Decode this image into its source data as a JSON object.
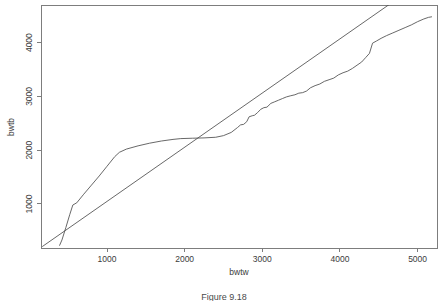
{
  "figure": {
    "caption": "Figure 9.18",
    "background_color": "#ffffff",
    "line_color": "#4d4d4d",
    "axis_color": "#7d7d7d",
    "text_color": "#3b3b3b"
  },
  "chart_data": {
    "type": "line",
    "title": "",
    "subtitle": "",
    "xlabel": "bwtw",
    "ylabel": "bwtb",
    "xlim": [
      150,
      5250
    ],
    "ylim": [
      180,
      4700
    ],
    "xticks": [
      1000,
      2000,
      3000,
      4000,
      5000
    ],
    "xtick_labels": [
      "1000",
      "2000",
      "3000",
      "4000",
      "5000"
    ],
    "yticks": [
      1000,
      2000,
      3000,
      4000
    ],
    "ytick_labels": [
      "1000",
      "2000",
      "3000",
      "4000"
    ],
    "grid": false,
    "legend": "none",
    "box": true,
    "series": [
      {
        "name": "reference-line",
        "style": "straight",
        "description": "straight diagonal reference line",
        "x": [
          170,
          5250
        ],
        "y": [
          210,
          5330
        ]
      },
      {
        "name": "empirical-curve",
        "style": "stepped",
        "description": "stepped empirical curve rising steeply then flattening",
        "x": [
          390,
          420,
          470,
          520,
          560,
          610,
          700,
          800,
          900,
          1000,
          1100,
          1160,
          1250,
          1400,
          1550,
          1700,
          1850,
          1950,
          2100,
          2250,
          2400,
          2500,
          2600,
          2680,
          2720,
          2760,
          2800,
          2830,
          2870,
          2900,
          2940,
          2980,
          3020,
          3060,
          3110,
          3160,
          3210,
          3260,
          3310,
          3360,
          3420,
          3470,
          3520,
          3570,
          3620,
          3680,
          3740,
          3800,
          3860,
          3920,
          3980,
          4040,
          4100,
          4160,
          4220,
          4280,
          4330,
          4380,
          4420,
          4470,
          4530,
          4600,
          4680,
          4760,
          4840,
          4920,
          5000,
          5080,
          5140,
          5180
        ],
        "y": [
          230,
          330,
          560,
          800,
          980,
          1020,
          1180,
          1350,
          1520,
          1700,
          1880,
          1960,
          2020,
          2080,
          2130,
          2170,
          2200,
          2215,
          2222,
          2228,
          2240,
          2270,
          2330,
          2420,
          2470,
          2480,
          2530,
          2620,
          2640,
          2650,
          2700,
          2760,
          2790,
          2800,
          2870,
          2900,
          2930,
          2960,
          2990,
          3010,
          3030,
          3060,
          3070,
          3100,
          3160,
          3200,
          3230,
          3280,
          3310,
          3340,
          3400,
          3440,
          3470,
          3520,
          3580,
          3640,
          3720,
          3800,
          3990,
          4030,
          4080,
          4130,
          4180,
          4230,
          4280,
          4330,
          4390,
          4440,
          4470,
          4480
        ]
      }
    ]
  }
}
